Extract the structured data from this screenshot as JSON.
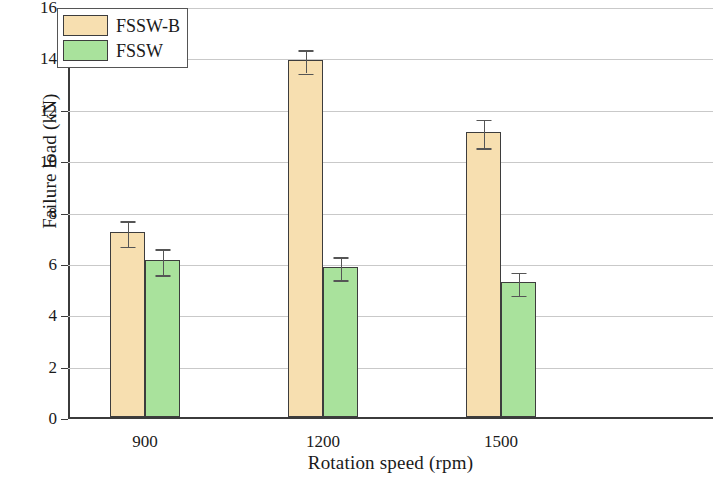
{
  "chart_data": {
    "type": "bar",
    "title": "",
    "xlabel": "Rotation speed (rpm)",
    "ylabel": "Failure load (kN)",
    "categories": [
      "900",
      "1200",
      "1500"
    ],
    "ylim": [
      0,
      16
    ],
    "yticks": [
      0,
      2,
      4,
      6,
      8,
      10,
      12,
      14,
      16
    ],
    "ytick_labels": [
      "0",
      "2",
      "4",
      "6",
      "8",
      "10",
      "12",
      "14",
      "16"
    ],
    "grid": true,
    "grid_axis": "y",
    "legend_position": "top-left",
    "series": [
      {
        "name": "FSSW-B",
        "color": "#f7dfb0",
        "values": [
          7.2,
          13.9,
          11.1
        ],
        "errors": [
          0.5,
          0.45,
          0.55
        ]
      },
      {
        "name": "FSSW",
        "color": "#a9e29c",
        "values": [
          6.1,
          5.85,
          5.25
        ],
        "errors": [
          0.5,
          0.45,
          0.45
        ]
      }
    ]
  },
  "legend": {
    "items": [
      {
        "label": "FSSW-B"
      },
      {
        "label": "FSSW"
      }
    ]
  },
  "colors": {
    "series_a": "#f7dfb0",
    "series_b": "#a9e29c",
    "axis": "#3b3b3b",
    "grid": "#c9c9c9",
    "bar_edge": "#3d3d3d"
  }
}
